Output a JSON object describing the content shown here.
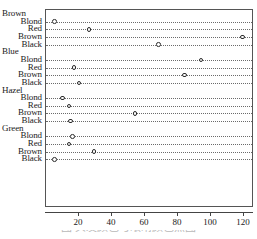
{
  "chart_data": {
    "type": "scatter",
    "subtype": "cleveland-dot-plot",
    "title": "",
    "subtitle": "",
    "xlabel": "",
    "ylabel": "",
    "xlim": [
      0,
      126
    ],
    "ylim_rows": 16,
    "grid": true,
    "grid_style": "dotted-horizontal",
    "legend": false,
    "legend_position": "none",
    "x_ticks": [
      20,
      40,
      60,
      80,
      100,
      120
    ],
    "x_tick_labels": [
      "20",
      "40",
      "60",
      "80",
      "100",
      "120"
    ],
    "groups": [
      {
        "label": "Brown",
        "categories": [
          "Blond",
          "Red",
          "Brown",
          "Black"
        ],
        "values": [
          5,
          26,
          119,
          68
        ]
      },
      {
        "label": "Blue",
        "categories": [
          "Blond",
          "Red",
          "Brown",
          "Black"
        ],
        "values": [
          94,
          17,
          84,
          20
        ]
      },
      {
        "label": "Hazel",
        "categories": [
          "Blond",
          "Red",
          "Brown",
          "Black"
        ],
        "values": [
          10,
          14,
          54,
          15
        ]
      },
      {
        "label": "Green",
        "categories": [
          "Blond",
          "Red",
          "Brown",
          "Black"
        ],
        "values": [
          16,
          14,
          29,
          5
        ]
      }
    ],
    "colors": {
      "point_stroke": "#2b2b2b",
      "point_fill": "#ffffff",
      "grid": "#6b6b6b",
      "axis": "#444444",
      "box": "#555555",
      "text": "#1a1a1a"
    }
  },
  "caption": {
    "text": "图 头发颜色与眼睛颜色点图"
  }
}
